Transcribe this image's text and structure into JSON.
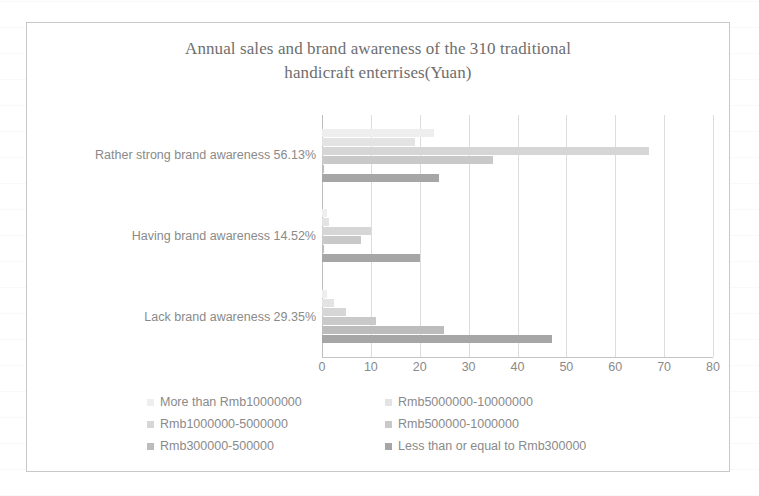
{
  "chart_data": {
    "type": "bar",
    "orientation": "horizontal",
    "title": "Annual sales and brand awareness of the 310 traditional handicraft enterrises(Yuan)",
    "title_line1": "Annual sales and brand awareness of the 310 traditional",
    "title_line2": "handicraft enterrises(Yuan)",
    "xlabel": "",
    "ylabel": "",
    "xlim": [
      0,
      80
    ],
    "xticks": [
      0,
      10,
      20,
      30,
      40,
      50,
      60,
      70,
      80
    ],
    "xtick_labels": [
      "0",
      "10",
      "20",
      "30",
      "40",
      "50",
      "60",
      "70",
      "80"
    ],
    "grid": true,
    "legend_position": "bottom",
    "categories": [
      "Rather strong brand awareness 56.13%",
      "Having brand awareness 14.52%",
      "Lack brand awareness  29.35%"
    ],
    "series": [
      {
        "name": "More than Rmb10000000",
        "color": "#eeeeee",
        "values": [
          23,
          1,
          1
        ]
      },
      {
        "name": "Rmb5000000-10000000",
        "color": "#e3e3e3",
        "values": [
          19,
          1.5,
          2.5
        ]
      },
      {
        "name": "Rmb1000000-5000000",
        "color": "#d6d6d6",
        "values": [
          67,
          10,
          5
        ]
      },
      {
        "name": "Rmb500000-1000000",
        "color": "#c9c9c9",
        "values": [
          35,
          8,
          11
        ]
      },
      {
        "name": "Rmb300000-500000",
        "color": "#bcbcbc",
        "values": [
          0.4,
          0.4,
          25
        ]
      },
      {
        "name": "Less than or equal to Rmb300000",
        "color": "#a6a6a6",
        "values": [
          24,
          20,
          47
        ]
      }
    ]
  },
  "legend": {
    "items": [
      "More than Rmb10000000",
      "Rmb5000000-10000000",
      "Rmb1000000-5000000",
      "Rmb500000-1000000",
      "Rmb300000-500000",
      "Less than or equal to Rmb300000"
    ]
  },
  "colors": {
    "frame": "#c8c8c8",
    "gridline": "#dcdcdc",
    "axis": "#c4c4c4",
    "text": "#8a8a8a",
    "title_text": "#6e6e6e"
  }
}
